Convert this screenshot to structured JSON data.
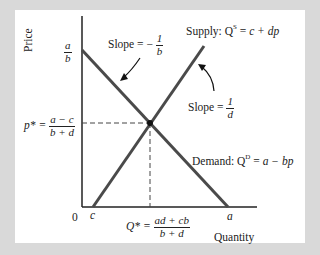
{
  "diagram": {
    "type": "supply-demand",
    "axes": {
      "y_label": "Price",
      "x_label": "Quantity",
      "origin_label": "0"
    },
    "y_ticks": {
      "intercept": {
        "num": "a",
        "den": "b"
      },
      "equilibrium": {
        "prefix": "p* =",
        "num": "a − c",
        "den": "b + d"
      }
    },
    "x_ticks": {
      "c": "c",
      "a": "a",
      "equilibrium": {
        "prefix": "Q* =",
        "num": "ad + cb",
        "den": "b + d"
      }
    },
    "curves": {
      "supply": {
        "prefix": "Supply: Q",
        "sup": "S",
        "eq": " = ",
        "expr": "c + dp",
        "slope_prefix": "Slope =",
        "slope_num": "1",
        "slope_den": "d"
      },
      "demand": {
        "prefix": "Demand: Q",
        "sup": "D",
        "eq": " = ",
        "expr": "a − bp",
        "slope_prefix": "Slope = −",
        "slope_num": "1",
        "slope_den": "b"
      }
    },
    "colors": {
      "background": "#d9d9d9",
      "panel": "#ffffff",
      "curve": "#4a4a4a",
      "axis": "#222222"
    }
  }
}
